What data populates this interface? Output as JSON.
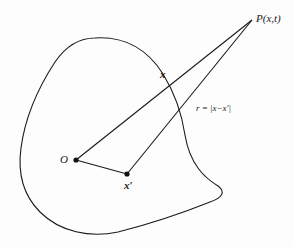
{
  "figure": {
    "type": "vector-geometry-diagram",
    "region": "closed irregular source region (blob)",
    "points": [
      {
        "id": "P",
        "label": "P(x,t)",
        "role": "field point",
        "x": 252,
        "y": 20
      },
      {
        "id": "O",
        "label": "O",
        "role": "origin",
        "x": 76,
        "y": 160
      },
      {
        "id": "xp",
        "label": "x′",
        "role": "source point",
        "x": 127,
        "y": 174
      }
    ],
    "segments": [
      {
        "from": "O",
        "to": "P",
        "label": "x"
      },
      {
        "from": "O",
        "to": "xp",
        "label": ""
      },
      {
        "from": "xp",
        "to": "P",
        "label": "r = |x−x′|"
      }
    ],
    "colors": {
      "stroke": "#1a1a1a",
      "background": "#fdfdfd"
    }
  },
  "labels": {
    "P": "P(x,t)",
    "O": "O",
    "x_prime": "x′",
    "x_vector": "x",
    "r": "r = |x−x′|"
  }
}
